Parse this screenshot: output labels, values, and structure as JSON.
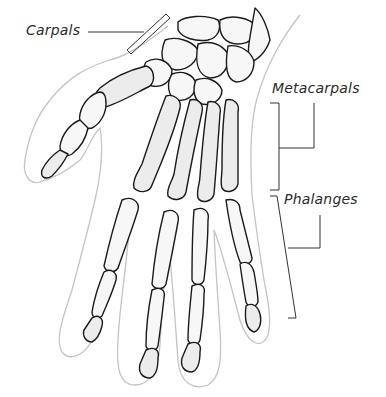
{
  "diagram": {
    "colors": {
      "background": "#ffffff",
      "bone_outline": "#1a1a1a",
      "bone_fill": "#ececec",
      "hand_outline": "#c4c4c4",
      "label_text": "#2b2b2b",
      "leader_line": "#333333"
    },
    "labels": [
      {
        "id": "carpals",
        "text": "Carpals"
      },
      {
        "id": "metacarpals",
        "text": "Metacarpals"
      },
      {
        "id": "phalanges",
        "text": "Phalanges"
      }
    ]
  }
}
